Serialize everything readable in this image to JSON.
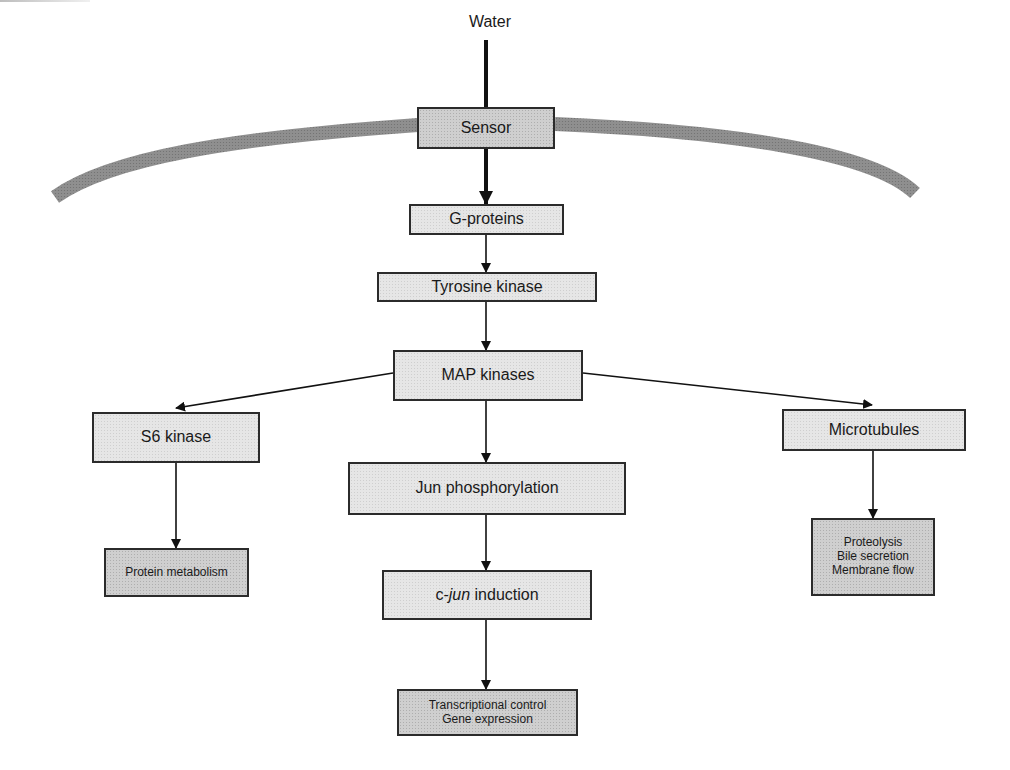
{
  "input_label": "Water",
  "membrane": {
    "color": "#8a8a8a",
    "name": "cell-membrane"
  },
  "nodes": {
    "sensor": {
      "label": "Sensor"
    },
    "g_proteins": {
      "label": "G-proteins"
    },
    "tyrosine_kinase": {
      "label": "Tyrosine kinase"
    },
    "map_kinases": {
      "label": "MAP kinases"
    },
    "s6_kinase": {
      "label": "S6 kinase"
    },
    "jun_phosphorylation": {
      "label": "Jun phosphorylation"
    },
    "microtubules": {
      "label": "Microtubules"
    },
    "cjun_induction": {
      "prefix": "c-",
      "italic": "jun",
      "suffix": " induction"
    },
    "protein_metabolism": {
      "label": "Protein metabolism"
    },
    "microtubule_effects": {
      "lines": [
        "Proteolysis",
        "Bile secretion",
        "Membrane flow"
      ]
    },
    "transcription": {
      "lines": [
        "Transcriptional control",
        "Gene expression"
      ]
    }
  },
  "edges": [
    {
      "from": "Water",
      "to": "Sensor"
    },
    {
      "from": "Sensor",
      "to": "G-proteins"
    },
    {
      "from": "G-proteins",
      "to": "Tyrosine kinase"
    },
    {
      "from": "Tyrosine kinase",
      "to": "MAP kinases"
    },
    {
      "from": "MAP kinases",
      "to": "S6 kinase"
    },
    {
      "from": "MAP kinases",
      "to": "Jun phosphorylation"
    },
    {
      "from": "MAP kinases",
      "to": "Microtubules"
    },
    {
      "from": "S6 kinase",
      "to": "Protein metabolism"
    },
    {
      "from": "Jun phosphorylation",
      "to": "c-jun induction"
    },
    {
      "from": "c-jun induction",
      "to": "Transcriptional control / Gene expression"
    },
    {
      "from": "Microtubules",
      "to": "Proteolysis / Bile secretion / Membrane flow"
    }
  ],
  "colors": {
    "box_fill": "#e6e6e6",
    "box_fill_dark": "#cfcfcf",
    "stroke": "#1a1a1a",
    "membrane": "#8a8a8a"
  }
}
